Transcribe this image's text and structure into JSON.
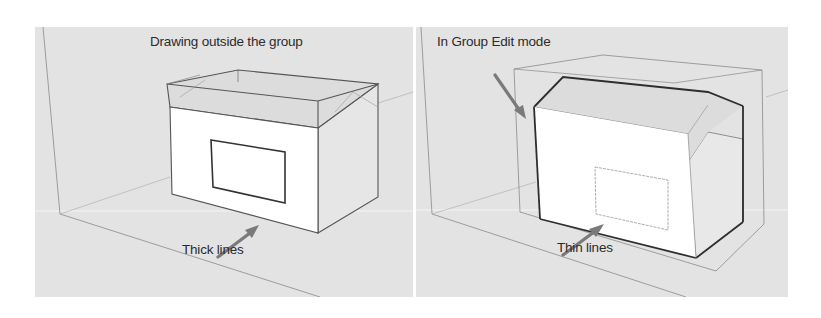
{
  "figure": {
    "panels": [
      {
        "id": "left",
        "title": "Drawing outside the group",
        "callout": "Thick lines",
        "mode": "outside-group",
        "edge_style": "thick"
      },
      {
        "id": "right",
        "title": "In Group Edit mode",
        "callout": "Thin lines",
        "mode": "group-edit",
        "edge_style": "thin"
      }
    ],
    "colors": {
      "background": "#e3e3e3",
      "face": "#ffffff",
      "edge": "#555555",
      "arrow": "#7a7a7a",
      "text": "#2b2b2b"
    }
  }
}
